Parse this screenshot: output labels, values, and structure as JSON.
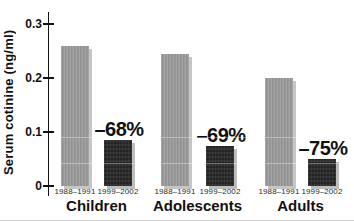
{
  "chart_data": {
    "type": "bar",
    "ylabel": "Serum cotinine (ng/ml)",
    "ylim": [
      0,
      0.32
    ],
    "yticks": [
      0,
      0.1,
      0.2,
      0.3
    ],
    "ytick_labels": [
      "0",
      "0.1",
      "0.2",
      "0.3"
    ],
    "series_labels": [
      "1988–1991",
      "1999–2002"
    ],
    "groups": [
      {
        "label": "Children",
        "values": [
          0.26,
          0.085
        ],
        "change": "–68%"
      },
      {
        "label": "Adolescents",
        "values": [
          0.245,
          0.075
        ],
        "change": "–69%"
      },
      {
        "label": "Adults",
        "values": [
          0.2,
          0.05
        ],
        "change": "–75%"
      }
    ],
    "colors": {
      "series1_bar": "#9a9a9a",
      "series2_bar": "#242424",
      "shadow": "#c6c6c6",
      "text": "#111111"
    },
    "grid": false,
    "legend_position": "none"
  }
}
